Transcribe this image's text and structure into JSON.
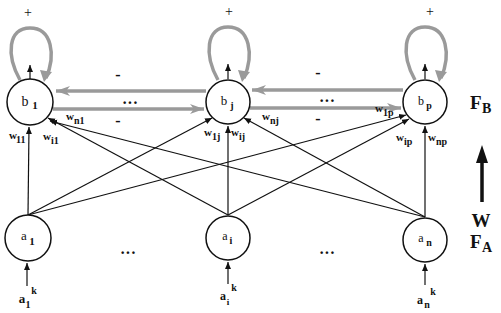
{
  "diagram": {
    "type": "neural-network-two-layer",
    "colors": {
      "node_stroke": "#111111",
      "feedforward": "#111111",
      "lateral": "#9a9a9a",
      "self_loop": "#9a9a9a",
      "background": "#ffffff"
    },
    "layer_labels": {
      "FB_main": "F",
      "FB_sub": "B",
      "FA_main": "F",
      "FA_sub": "A",
      "weights": "W"
    },
    "output_layer": {
      "nodes": [
        {
          "id": "b1",
          "main": "b",
          "sub": "1",
          "loop_sign": "+"
        },
        {
          "id": "bj",
          "main": "b",
          "sub": "j",
          "loop_sign": "+"
        },
        {
          "id": "bp",
          "main": "b",
          "sub": "p",
          "loop_sign": "+"
        }
      ],
      "ellipsis": "···",
      "lateral_signs": [
        "-",
        "-",
        "-",
        "-"
      ]
    },
    "input_layer": {
      "nodes": [
        {
          "id": "a1",
          "main": "a",
          "sub": "1",
          "input_main": "a",
          "input_sub": "1",
          "input_sup": "k"
        },
        {
          "id": "ai",
          "main": "a",
          "sub": "i",
          "input_main": "a",
          "input_sub": "i",
          "input_sup": "k"
        },
        {
          "id": "an",
          "main": "a",
          "sub": "n",
          "input_main": "a",
          "input_sub": "n",
          "input_sup": "k"
        }
      ],
      "ellipsis": "···"
    },
    "weight_labels": {
      "w11": {
        "main": "w",
        "sub": "11"
      },
      "wi1": {
        "main": "w",
        "sub": "i1"
      },
      "wn1": {
        "main": "w",
        "sub": "n1"
      },
      "w1j": {
        "main": "w",
        "sub": "1j"
      },
      "wij": {
        "main": "w",
        "sub": "ij"
      },
      "wnj": {
        "main": "w",
        "sub": "nj"
      },
      "w1p": {
        "main": "w",
        "sub": "1p"
      },
      "wip": {
        "main": "w",
        "sub": "ip"
      },
      "wnp": {
        "main": "w",
        "sub": "np"
      }
    }
  }
}
